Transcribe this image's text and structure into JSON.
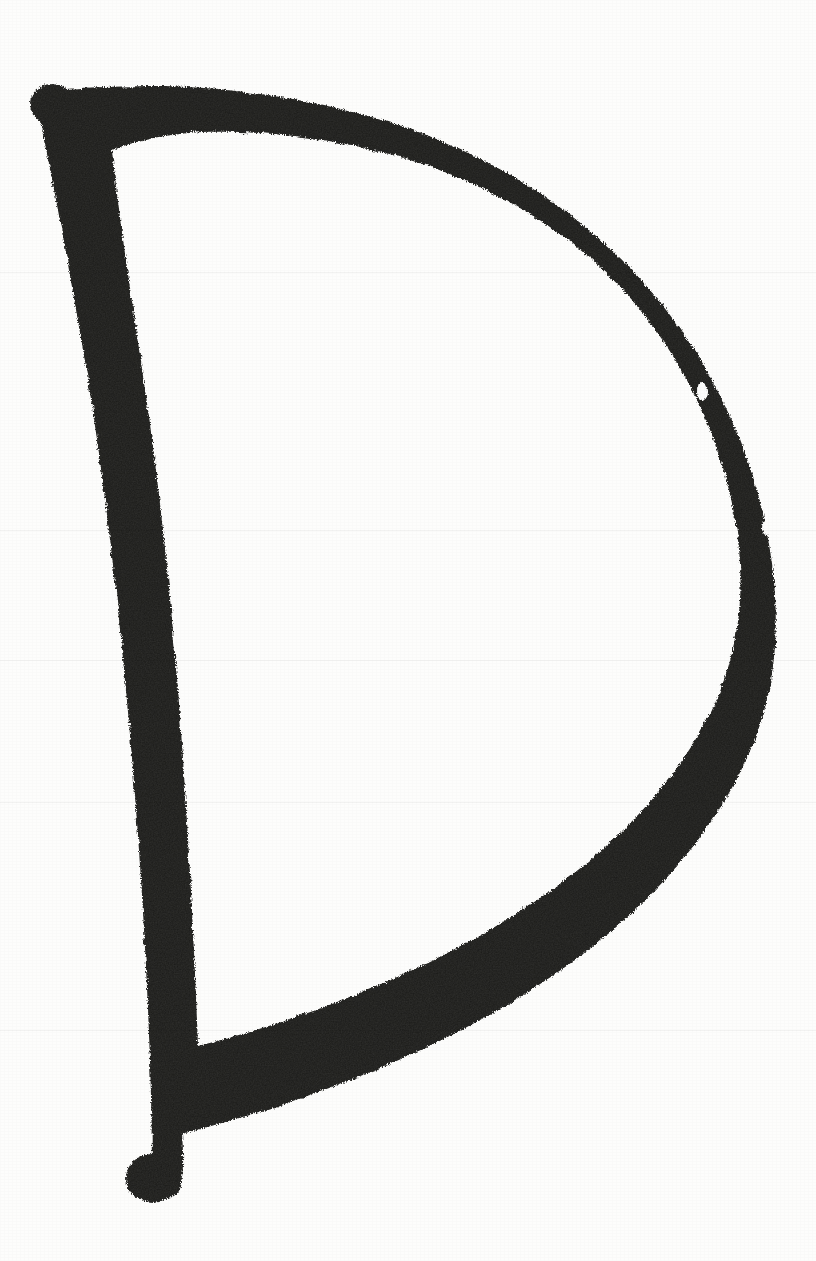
{
  "image": {
    "kind": "scanned-handwriting",
    "subject": "uppercase letter D",
    "character": "D",
    "title": "Handwritten Letter D",
    "alt_text": "A large hand-drawn uppercase letter D rendered with a thick black marker on white paper",
    "width": 816,
    "height": 1261,
    "background_color": "#fdfdfc",
    "ink_color": "#1a1a18",
    "ink_color_core": "#141413",
    "ink_color_edge": "#2a2a27",
    "stroke_style": "thick dry marker, textured ragged edges",
    "stroke_count": 1,
    "orientation": "upright",
    "notes": "single continuous closed stroke: vertical stem down the left, bowl sweeping out to the right"
  },
  "geometry": {
    "stem_top_point": "37, 92",
    "stem_bottom_point": "145, 1195",
    "bowl_rightmost_x": 772,
    "bowl_rightmost_y": 560,
    "stem_width_px": 64,
    "bowl_width_px": 78,
    "counter_label": "enclosed white counter"
  },
  "strokes": {
    "outer_path": "M 44 96 C 38 104 38 116 42 130 C 56 196 72 284 88 380 C 104 480 118 600 128 712 C 138 824 146 940 150 1062 C 152 1122 152 1160 152 1190 C 156 1200 168 1202 176 1194 C 184 1184 184 1160 182 1134 C 228 1122 282 1106 340 1084 C 430 1050 520 1004 596 944 C 668 886 726 816 756 736 C 782 666 780 592 764 518 C 746 436 706 356 650 290 C 590 220 512 168 424 134 C 344 104 248 88 164 86 C 116 86 74 88 52 90 Z",
    "inner_path": "M 112 150 C 118 212 132 300 146 396 C 160 492 172 606 180 716 C 188 826 194 938 198 1046 C 246 1034 298 1018 352 996 C 438 962 520 918 588 862 C 650 810 700 748 724 680 C 746 618 744 556 730 494 C 714 424 680 356 632 300 C 580 240 512 196 434 168 C 362 142 278 130 202 132 C 168 134 138 140 112 150 Z",
    "top_blob": {
      "cx": 52,
      "cy": 104,
      "rx": 22,
      "ry": 20
    },
    "bottom_blob": {
      "cx": 152,
      "cy": 1178,
      "rx": 26,
      "ry": 24
    },
    "speck_1": {
      "cx": 702,
      "cy": 392,
      "rx": 5,
      "ry": 9
    },
    "speck_2": {
      "cx": 766,
      "cy": 528,
      "rx": 4,
      "ry": 7
    }
  },
  "scan_seams": [
    {
      "y": 272
    },
    {
      "y": 530
    },
    {
      "y": 660
    },
    {
      "y": 802
    },
    {
      "y": 1030
    }
  ]
}
